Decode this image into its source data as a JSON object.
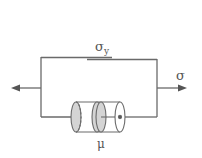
{
  "diagram": {
    "labels": {
      "yield_stress": "σ",
      "yield_stress_sub": "y",
      "stress": "σ",
      "viscosity": "μ"
    },
    "elements": [
      {
        "type": "friction-slider",
        "label": "σy",
        "position": "top-branch"
      },
      {
        "type": "dashpot",
        "label": "μ",
        "position": "bottom-branch"
      }
    ],
    "connection": "parallel",
    "colors": {
      "line": "#6a6a6a",
      "fill": "#d4d4d4",
      "text": "#555555"
    }
  }
}
